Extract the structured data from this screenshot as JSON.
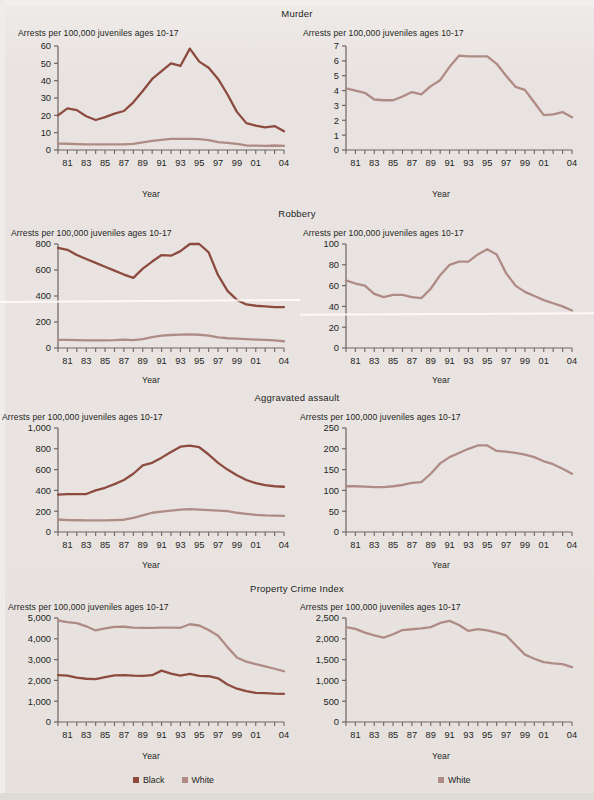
{
  "figure": {
    "background": "#e9e5e2",
    "axis_label_y": "Arrests per 100,000 juveniles ages 10-17",
    "axis_label_x": "Year",
    "tick_years": [
      "81",
      "83",
      "85",
      "87",
      "89",
      "91",
      "93",
      "95",
      "97",
      "99",
      "01",
      "04"
    ],
    "colors": {
      "black_series": "#8d4b3f",
      "white_series": "#b08b86",
      "axis": "#6e6462",
      "text": "#231f1d"
    }
  },
  "legend": {
    "left": [
      {
        "label": "Black",
        "color": "#8d4b3f"
      },
      {
        "label": "White",
        "color": "#b08b86"
      }
    ],
    "right": [
      {
        "label": "White",
        "color": "#b08b86"
      }
    ]
  },
  "sections": [
    {
      "title": "Murder"
    },
    {
      "title": "Robbery"
    },
    {
      "title": "Aggravated assault"
    },
    {
      "title": "Property Crime Index"
    }
  ],
  "chart_data": [
    {
      "type": "line",
      "title": "Murder",
      "panel": "left",
      "xlabel": "Year",
      "ylabel": "Arrests per 100,000 juveniles ages 10-17",
      "x": [
        1980,
        1981,
        1982,
        1983,
        1984,
        1985,
        1986,
        1987,
        1988,
        1989,
        1990,
        1991,
        1992,
        1993,
        1994,
        1995,
        1996,
        1997,
        1998,
        1999,
        2000,
        2001,
        2002,
        2003,
        2004
      ],
      "xticklabels": [
        "81",
        "83",
        "85",
        "87",
        "89",
        "91",
        "93",
        "95",
        "97",
        "99",
        "01",
        "04"
      ],
      "ylim": [
        0,
        60
      ],
      "yticks": [
        0,
        10,
        20,
        30,
        40,
        50,
        60
      ],
      "yticklabels": [
        "0",
        "10",
        "20",
        "30",
        "40",
        "50",
        "60"
      ],
      "grid": false,
      "series": [
        {
          "name": "Black",
          "color": "#8d4b3f",
          "values": [
            20.0,
            24.0,
            23.0,
            19.5,
            17.3,
            19.0,
            21.0,
            22.5,
            27.5,
            34.0,
            41.0,
            45.5,
            50.0,
            48.5,
            58.5,
            51.0,
            47.5,
            41.0,
            32.0,
            22.0,
            15.5,
            14.0,
            13.0,
            13.8,
            10.8
          ]
        },
        {
          "name": "White",
          "color": "#b08b86",
          "values": [
            3.7,
            3.6,
            3.4,
            3.3,
            3.3,
            3.2,
            3.3,
            3.3,
            3.5,
            4.4,
            5.3,
            5.9,
            6.4,
            6.4,
            6.4,
            6.3,
            5.7,
            4.6,
            4.1,
            3.5,
            2.6,
            2.5,
            2.4,
            2.6,
            2.4
          ]
        }
      ]
    },
    {
      "type": "line",
      "title": "Murder",
      "panel": "right",
      "xlabel": "Year",
      "ylabel": "Arrests per 100,000 juveniles ages 10-17",
      "x": [
        1980,
        1981,
        1982,
        1983,
        1984,
        1985,
        1986,
        1987,
        1988,
        1989,
        1990,
        1991,
        1992,
        1993,
        1994,
        1995,
        1996,
        1997,
        1998,
        1999,
        2000,
        2001,
        2002,
        2003,
        2004
      ],
      "xticklabels": [
        "81",
        "83",
        "85",
        "87",
        "89",
        "91",
        "93",
        "95",
        "97",
        "99",
        "01",
        "04"
      ],
      "ylim": [
        0,
        7
      ],
      "yticks": [
        0,
        1,
        2,
        3,
        4,
        5,
        6,
        7
      ],
      "yticklabels": [
        "0",
        "1",
        "2",
        "3",
        "4",
        "5",
        "6",
        "7"
      ],
      "grid": false,
      "series": [
        {
          "name": "White",
          "color": "#b08b86",
          "values": [
            4.15,
            4.0,
            3.85,
            3.4,
            3.35,
            3.35,
            3.6,
            3.9,
            3.75,
            4.3,
            4.7,
            5.6,
            6.35,
            6.3,
            6.3,
            6.3,
            5.8,
            5.0,
            4.25,
            4.05,
            3.2,
            2.35,
            2.4,
            2.55,
            2.2
          ]
        }
      ]
    },
    {
      "type": "line",
      "title": "Robbery",
      "panel": "left",
      "xlabel": "Year",
      "ylabel": "Arrests per 100,000 juveniles ages 10-17",
      "x": [
        1980,
        1981,
        1982,
        1983,
        1984,
        1985,
        1986,
        1987,
        1988,
        1989,
        1990,
        1991,
        1992,
        1993,
        1994,
        1995,
        1996,
        1997,
        1998,
        1999,
        2000,
        2001,
        2002,
        2003,
        2004
      ],
      "xticklabels": [
        "81",
        "83",
        "85",
        "87",
        "89",
        "91",
        "93",
        "95",
        "97",
        "99",
        "01",
        "04"
      ],
      "ylim": [
        0,
        800
      ],
      "yticks": [
        0,
        200,
        400,
        600,
        800
      ],
      "yticklabels": [
        "0",
        "200",
        "400",
        "600",
        "800"
      ],
      "grid": false,
      "series": [
        {
          "name": "Black",
          "color": "#8d4b3f",
          "values": [
            770,
            755,
            715,
            685,
            655,
            625,
            595,
            565,
            540,
            610,
            665,
            715,
            710,
            745,
            800,
            800,
            735,
            560,
            440,
            370,
            335,
            325,
            320,
            315,
            315
          ]
        },
        {
          "name": "White",
          "color": "#b08b86",
          "values": [
            63,
            62,
            60,
            59,
            58,
            58,
            60,
            65,
            60,
            68,
            83,
            95,
            100,
            103,
            105,
            102,
            95,
            82,
            75,
            72,
            68,
            65,
            62,
            58,
            52
          ]
        }
      ]
    },
    {
      "type": "line",
      "title": "Robbery",
      "panel": "right",
      "xlabel": "Year",
      "ylabel": "Arrests per 100,000 juveniles ages 10-17",
      "x": [
        1980,
        1981,
        1982,
        1983,
        1984,
        1985,
        1986,
        1987,
        1988,
        1989,
        1990,
        1991,
        1992,
        1993,
        1994,
        1995,
        1996,
        1997,
        1998,
        1999,
        2000,
        2001,
        2002,
        2003,
        2004
      ],
      "xticklabels": [
        "81",
        "83",
        "85",
        "87",
        "89",
        "91",
        "93",
        "95",
        "97",
        "99",
        "01",
        "04"
      ],
      "ylim": [
        0,
        100
      ],
      "yticks": [
        0,
        20,
        40,
        60,
        80,
        100
      ],
      "yticklabels": [
        "0",
        "20",
        "40",
        "60",
        "80",
        "100"
      ],
      "grid": false,
      "series": [
        {
          "name": "White",
          "color": "#b08b86",
          "values": [
            65,
            62,
            60,
            52,
            49,
            51,
            51,
            49,
            48,
            57,
            70,
            80,
            83,
            83,
            90,
            95,
            90,
            72,
            60,
            54,
            50,
            46,
            43,
            40,
            36
          ]
        }
      ]
    },
    {
      "type": "line",
      "title": "Aggravated assault",
      "panel": "left",
      "xlabel": "Year",
      "ylabel": "Arrests per 100,000 juveniles ages 10-17",
      "x": [
        1980,
        1981,
        1982,
        1983,
        1984,
        1985,
        1986,
        1987,
        1988,
        1989,
        1990,
        1991,
        1992,
        1993,
        1994,
        1995,
        1996,
        1997,
        1998,
        1999,
        2000,
        2001,
        2002,
        2003,
        2004
      ],
      "xticklabels": [
        "81",
        "83",
        "85",
        "87",
        "89",
        "91",
        "93",
        "95",
        "97",
        "99",
        "01",
        "04"
      ],
      "ylim": [
        0,
        1000
      ],
      "yticks": [
        0,
        200,
        400,
        600,
        800,
        1000
      ],
      "yticklabels": [
        "0",
        "200",
        "400",
        "600",
        "800",
        "1,000"
      ],
      "grid": false,
      "series": [
        {
          "name": "Black",
          "color": "#8d4b3f",
          "values": [
            360,
            365,
            365,
            365,
            400,
            425,
            460,
            500,
            560,
            640,
            665,
            715,
            770,
            820,
            830,
            815,
            745,
            665,
            600,
            545,
            500,
            470,
            450,
            440,
            435
          ]
        },
        {
          "name": "White",
          "color": "#b08b86",
          "values": [
            120,
            115,
            113,
            112,
            112,
            112,
            115,
            118,
            135,
            160,
            185,
            195,
            205,
            215,
            220,
            215,
            210,
            205,
            200,
            185,
            175,
            165,
            160,
            158,
            155
          ]
        }
      ]
    },
    {
      "type": "line",
      "title": "Aggravated assault",
      "panel": "right",
      "xlabel": "Year",
      "ylabel": "Arrests per 100,000 juveniles ages 10-17",
      "x": [
        1980,
        1981,
        1982,
        1983,
        1984,
        1985,
        1986,
        1987,
        1988,
        1989,
        1990,
        1991,
        1992,
        1993,
        1994,
        1995,
        1996,
        1997,
        1998,
        1999,
        2000,
        2001,
        2002,
        2003,
        2004
      ],
      "xticklabels": [
        "81",
        "83",
        "85",
        "87",
        "89",
        "91",
        "93",
        "95",
        "97",
        "99",
        "01",
        "04"
      ],
      "ylim": [
        0,
        250
      ],
      "yticks": [
        0,
        50,
        100,
        150,
        200,
        250
      ],
      "yticklabels": [
        "0",
        "50",
        "100",
        "150",
        "200",
        "250"
      ],
      "grid": false,
      "series": [
        {
          "name": "White",
          "color": "#b08b86",
          "values": [
            110,
            110,
            109,
            108,
            108,
            110,
            113,
            118,
            120,
            140,
            165,
            180,
            190,
            200,
            208,
            208,
            195,
            193,
            190,
            186,
            180,
            170,
            163,
            152,
            140
          ]
        }
      ]
    },
    {
      "type": "line",
      "title": "Property Crime Index",
      "panel": "left",
      "xlabel": "Year",
      "ylabel": "Arrests per 100,000 juveniles ages 10-17",
      "x": [
        1980,
        1981,
        1982,
        1983,
        1984,
        1985,
        1986,
        1987,
        1988,
        1989,
        1990,
        1991,
        1992,
        1993,
        1994,
        1995,
        1996,
        1997,
        1998,
        1999,
        2000,
        2001,
        2002,
        2003,
        2004
      ],
      "xticklabels": [
        "81",
        "83",
        "85",
        "87",
        "89",
        "91",
        "93",
        "95",
        "97",
        "99",
        "01",
        "04"
      ],
      "ylim": [
        0,
        5000
      ],
      "yticks": [
        0,
        1000,
        2000,
        3000,
        4000,
        5000
      ],
      "yticklabels": [
        "0",
        "1,000",
        "2,000",
        "3,000",
        "4,000",
        "5,000"
      ],
      "grid": false,
      "series": [
        {
          "name": "Black",
          "color": "#8d4b3f",
          "values": [
            2250,
            2230,
            2130,
            2080,
            2060,
            2160,
            2240,
            2250,
            2230,
            2220,
            2250,
            2470,
            2330,
            2230,
            2310,
            2220,
            2200,
            2100,
            1800,
            1600,
            1480,
            1400,
            1385,
            1360,
            1355
          ]
        },
        {
          "name": "White",
          "color": "#b08b86",
          "values": [
            4880,
            4800,
            4750,
            4600,
            4400,
            4500,
            4570,
            4580,
            4540,
            4530,
            4530,
            4540,
            4540,
            4530,
            4700,
            4640,
            4420,
            4150,
            3600,
            3100,
            2900,
            2780,
            2670,
            2560,
            2440
          ]
        }
      ]
    },
    {
      "type": "line",
      "title": "Property Crime Index",
      "panel": "right",
      "xlabel": "Year",
      "ylabel": "Arrests per 100,000 juveniles ages 10-17",
      "x": [
        1980,
        1981,
        1982,
        1983,
        1984,
        1985,
        1986,
        1987,
        1988,
        1989,
        1990,
        1991,
        1992,
        1993,
        1994,
        1995,
        1996,
        1997,
        1998,
        1999,
        2000,
        2001,
        2002,
        2003,
        2004
      ],
      "xticklabels": [
        "81",
        "83",
        "85",
        "87",
        "89",
        "91",
        "93",
        "95",
        "97",
        "99",
        "01",
        "04"
      ],
      "ylim": [
        0,
        2500
      ],
      "yticks": [
        0,
        500,
        1000,
        1500,
        2000,
        2500
      ],
      "yticklabels": [
        "0",
        "500",
        "1,000",
        "1,500",
        "2,000",
        "2,500"
      ],
      "grid": false,
      "series": [
        {
          "name": "White",
          "color": "#b08b86",
          "values": [
            2280,
            2240,
            2150,
            2080,
            2030,
            2110,
            2210,
            2230,
            2250,
            2280,
            2380,
            2430,
            2330,
            2190,
            2230,
            2200,
            2150,
            2080,
            1850,
            1620,
            1520,
            1440,
            1410,
            1390,
            1320
          ]
        }
      ]
    }
  ]
}
